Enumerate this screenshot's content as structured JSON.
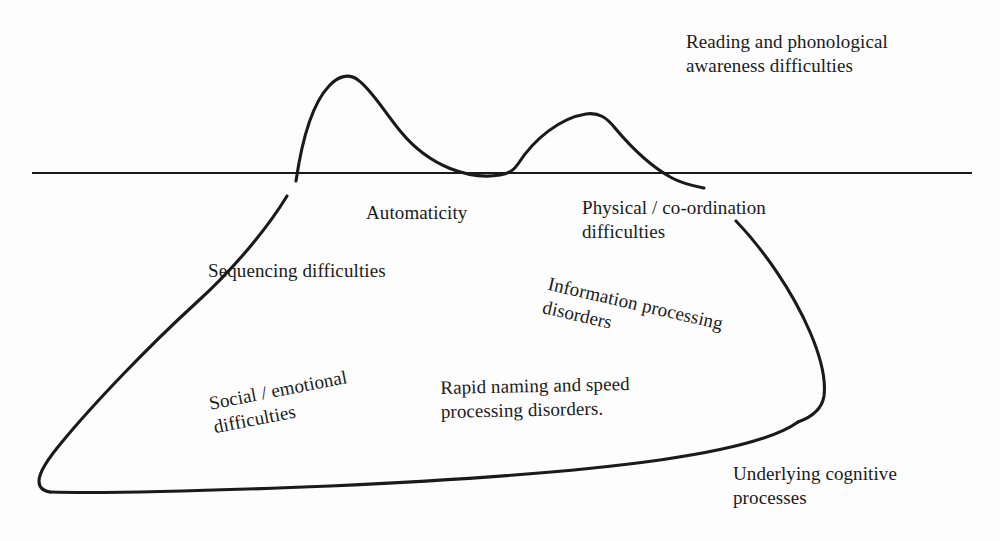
{
  "diagram": {
    "type": "iceberg-diagram",
    "background_color": "#fdfdfd",
    "line_color": "#1a1a1a",
    "text_color": "#1a1a1a",
    "waterline": {
      "name": "waterline",
      "x1": 32,
      "x2": 972,
      "y": 173
    },
    "labels": {
      "reading": "Reading and phonological\nawareness difficulties",
      "automaticity": "Automaticity",
      "physical": "Physical / co-ordination\ndifficulties",
      "sequencing": "Sequencing difficulties",
      "information": "Information processing\ndisorders",
      "social": "Social / emotional\ndifficulties",
      "rapid": "Rapid naming and speed\nprocessing disorders.",
      "underlying": "Underlying cognitive\nprocesses"
    }
  }
}
